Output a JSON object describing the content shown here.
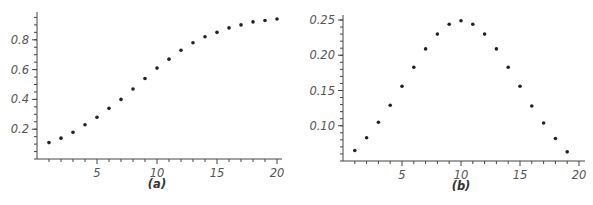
{
  "chart_data": [
    {
      "type": "scatter",
      "title": "",
      "caption": "(a)",
      "xlabel": "",
      "ylabel": "",
      "xlim": [
        0,
        20.5
      ],
      "ylim": [
        0,
        0.97
      ],
      "xticks": [
        5,
        10,
        15,
        20
      ],
      "yticks": [
        0.2,
        0.4,
        0.6,
        0.8
      ],
      "xtick_labels": [
        "5",
        "10",
        "15",
        "20"
      ],
      "ytick_labels": [
        "0.2",
        "0.4",
        "0.6",
        "0.8"
      ],
      "grid": false,
      "legend": null,
      "x": [
        1,
        2,
        3,
        4,
        5,
        6,
        7,
        8,
        9,
        10,
        11,
        12,
        13,
        14,
        15,
        16,
        17,
        18,
        19,
        20
      ],
      "y": [
        0.11,
        0.14,
        0.18,
        0.23,
        0.28,
        0.34,
        0.4,
        0.47,
        0.54,
        0.61,
        0.67,
        0.73,
        0.78,
        0.82,
        0.85,
        0.88,
        0.9,
        0.92,
        0.93,
        0.94
      ]
    },
    {
      "type": "scatter",
      "title": "",
      "caption": "(b)",
      "xlabel": "",
      "ylabel": "",
      "xlim": [
        0,
        20.5
      ],
      "ylim": [
        0.04,
        0.257
      ],
      "xticks": [
        5,
        10,
        15,
        20
      ],
      "yticks": [
        0.1,
        0.15,
        0.2,
        0.25
      ],
      "xtick_labels": [
        "5",
        "10",
        "15",
        "20"
      ],
      "ytick_labels": [
        "0.10",
        "0.15",
        "0.20",
        "0.25"
      ],
      "grid": false,
      "legend": null,
      "x": [
        1,
        2,
        3,
        4,
        5,
        6,
        7,
        8,
        9,
        10,
        11,
        12,
        13,
        14,
        15,
        16,
        17,
        18,
        19
      ],
      "y": [
        0.065,
        0.083,
        0.105,
        0.129,
        0.156,
        0.183,
        0.209,
        0.23,
        0.244,
        0.249,
        0.244,
        0.23,
        0.209,
        0.183,
        0.156,
        0.128,
        0.104,
        0.082,
        0.063
      ]
    }
  ]
}
